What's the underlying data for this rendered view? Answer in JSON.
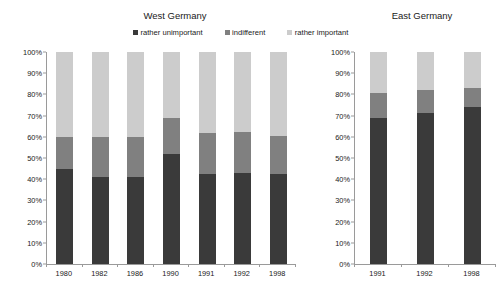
{
  "legend": {
    "items": [
      {
        "label": "rather unimportant",
        "color": "#3a3a3a",
        "icon": "legend-square-icon"
      },
      {
        "label": "indifferent",
        "color": "#808080",
        "icon": "legend-square-icon"
      },
      {
        "label": "rather important",
        "color": "#cccccc",
        "icon": "legend-square-icon"
      }
    ]
  },
  "panels": [
    {
      "title": "West Germany"
    },
    {
      "title": "East Germany"
    }
  ],
  "y_ticks": [
    "100%",
    "90%",
    "80%",
    "70%",
    "60%",
    "50%",
    "40%",
    "30%",
    "20%",
    "10%",
    "0%"
  ],
  "chart_data": [
    {
      "type": "bar",
      "title": "West Germany",
      "stacked": true,
      "xlabel": "",
      "ylabel": "",
      "ylim": [
        0,
        100
      ],
      "ytick_step": 10,
      "grid": false,
      "legend_position": "top-center",
      "categories": [
        "1980",
        "1982",
        "1986",
        "1990",
        "1991",
        "1992",
        "1998"
      ],
      "series": [
        {
          "name": "rather unimportant",
          "color": "#3a3a3a",
          "values": [
            45,
            41,
            41,
            52,
            42.5,
            43,
            42.5
          ]
        },
        {
          "name": "indifferent",
          "color": "#808080",
          "values": [
            15,
            19,
            19,
            17,
            19.5,
            19.5,
            18
          ]
        },
        {
          "name": "rather important",
          "color": "#cccccc",
          "values": [
            40,
            40,
            40,
            31,
            38,
            37.5,
            39.5
          ]
        }
      ]
    },
    {
      "type": "bar",
      "title": "East Germany",
      "stacked": true,
      "xlabel": "",
      "ylabel": "",
      "ylim": [
        0,
        100
      ],
      "ytick_step": 10,
      "grid": false,
      "legend_position": "top-center",
      "categories": [
        "1991",
        "1992",
        "1998"
      ],
      "series": [
        {
          "name": "rather unimportant",
          "color": "#3a3a3a",
          "values": [
            69,
            71,
            74
          ]
        },
        {
          "name": "indifferent",
          "color": "#808080",
          "values": [
            11.5,
            11,
            9
          ]
        },
        {
          "name": "rather important",
          "color": "#cccccc",
          "values": [
            19.5,
            18,
            17
          ]
        }
      ]
    }
  ]
}
